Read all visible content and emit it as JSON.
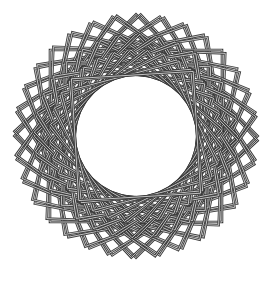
{
  "figure": {
    "center": [
      136,
      136
    ],
    "stroke_color": "#3a3a3a",
    "stroke_inner_color": "#ffffff",
    "background": "#ffffff",
    "layers": [
      {
        "name": "outer-squares",
        "half_side": 86,
        "count": 8,
        "step_deg": 11.25,
        "offset_deg": 45,
        "double_offset_deg": 2.2
      },
      {
        "name": "middle-squares",
        "half_side": 72,
        "count": 8,
        "step_deg": 11.25,
        "offset_deg": 0,
        "double_offset_deg": 2.2
      },
      {
        "name": "inner-squares",
        "half_side": 61,
        "count": 8,
        "step_deg": 11.25,
        "offset_deg": 5.6,
        "double_offset_deg": 2.2
      }
    ]
  }
}
